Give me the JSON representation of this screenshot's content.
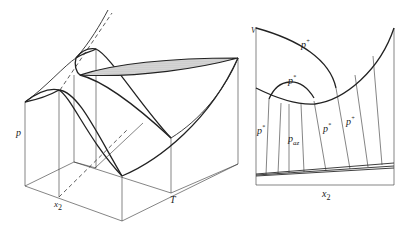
{
  "left_figure": {
    "description": "3D p-T-x2 phase diagram with azeotrope",
    "axes": {
      "p_label": "p",
      "x_label": "x",
      "x_sub": "2",
      "t_label": "T"
    }
  },
  "right_figure": {
    "description": "V-x2 projection with isobars",
    "axes": {
      "v_label": "V",
      "x_label": "x",
      "x_sub": "2"
    },
    "curve_labels": {
      "top": {
        "base": "p",
        "sup": "+"
      },
      "dome": {
        "base": "p",
        "sup": "*"
      },
      "left": {
        "base": "p",
        "sup": "*"
      },
      "az": {
        "base": "p",
        "sub": "az"
      },
      "middle": {
        "base": "p",
        "sup": "*"
      },
      "right": {
        "base": "p",
        "sup": "+"
      }
    }
  },
  "colors": {
    "line": "#222222",
    "background": "#ffffff",
    "shading": "#bdbdbd"
  }
}
